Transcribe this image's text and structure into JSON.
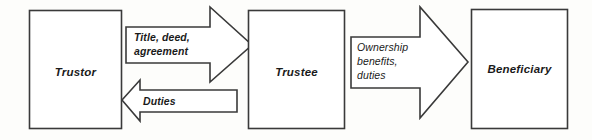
{
  "diagram": {
    "background_color": "#fdfdfb",
    "line_color": "#3a3a3a",
    "text_color": "#1a1a1a",
    "nodes": [
      {
        "id": "trustor",
        "label": "Trustor",
        "shape": "rectangle"
      },
      {
        "id": "trustee",
        "label": "Trustee",
        "shape": "rectangle"
      },
      {
        "id": "beneficiary",
        "label": "Beneficiary",
        "shape": "rectangle"
      }
    ],
    "edges": [
      {
        "id": "trustor-to-trustee",
        "from": "trustor",
        "to": "trustee",
        "direction": "right",
        "shape": "block-arrow",
        "label_lines": [
          "Title, deed,",
          "agreement"
        ],
        "label_line1": "Title, deed,",
        "label_line2": "agreement",
        "label_weight": "bold"
      },
      {
        "id": "trustee-to-trustor",
        "from": "trustee",
        "to": "trustor",
        "direction": "left",
        "shape": "block-arrow",
        "label_lines": [
          "Duties"
        ],
        "label_line1": "Duties",
        "label_weight": "bold"
      },
      {
        "id": "trustee-to-beneficiary",
        "from": "trustee",
        "to": "beneficiary",
        "direction": "right",
        "shape": "block-arrow",
        "label_lines": [
          "Ownership",
          "benefits,",
          "duties"
        ],
        "label_line1": "Ownership",
        "label_line2": "benefits,",
        "label_line3": "duties",
        "label_weight": "normal"
      }
    ]
  }
}
